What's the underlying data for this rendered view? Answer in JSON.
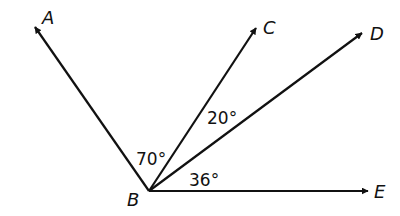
{
  "diagram": {
    "vertex": {
      "label": "B",
      "x": 149,
      "y": 191
    },
    "rays": [
      {
        "name": "A",
        "label": "A",
        "tip": [
          35,
          27
        ],
        "label_pos": [
          42,
          24
        ]
      },
      {
        "name": "C",
        "label": "C",
        "tip": [
          256,
          28
        ],
        "label_pos": [
          263,
          34
        ]
      },
      {
        "name": "D",
        "label": "D",
        "tip": [
          362,
          33
        ],
        "label_pos": [
          370,
          40
        ]
      },
      {
        "name": "E",
        "label": "E",
        "tip": [
          368,
          191
        ],
        "label_pos": [
          374,
          198
        ]
      }
    ],
    "angles": [
      {
        "between": "ABC",
        "label": "70°",
        "pos": [
          136,
          165
        ]
      },
      {
        "between": "CBD",
        "label": "20°",
        "pos": [
          207,
          124
        ]
      },
      {
        "between": "DBE",
        "label": "36°",
        "pos": [
          189,
          186
        ]
      }
    ],
    "line_color": "#111111"
  }
}
